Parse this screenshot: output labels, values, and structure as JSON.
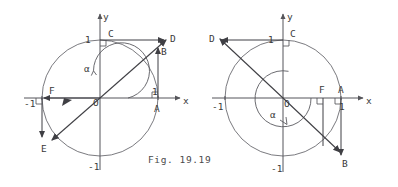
{
  "figure": {
    "caption": "Fig. 19.19",
    "panels": [
      {
        "id": "left",
        "name": "panel-left",
        "axis_labels": {
          "x": "x",
          "y": "y"
        },
        "ticks": {
          "x_pos": "1",
          "x_neg": "-1",
          "y_pos": "1",
          "y_neg": "-1"
        },
        "angle_label": "α",
        "points": [
          {
            "label": "A",
            "desc": "unit-point-on-positive-x-axis"
          },
          {
            "label": "B",
            "desc": "tangent-point-above-A"
          },
          {
            "label": "C",
            "desc": "unit-point-on-positive-y-axis"
          },
          {
            "label": "D",
            "desc": "cotangent-point-right-of-C"
          },
          {
            "label": "E",
            "desc": "terminal-point-lower-left-on-circle"
          },
          {
            "label": "F",
            "desc": "projection-point-on-negative-x-axis"
          }
        ]
      },
      {
        "id": "right",
        "name": "panel-right",
        "axis_labels": {
          "x": "x",
          "y": "y"
        },
        "ticks": {
          "x_pos": "1",
          "x_neg": "-1",
          "y_pos": "1",
          "y_neg": "-1"
        },
        "angle_label": "α",
        "points": [
          {
            "label": "A",
            "desc": "unit-point-on-positive-x-axis"
          },
          {
            "label": "B",
            "desc": "tangent-point-below-A"
          },
          {
            "label": "C",
            "desc": "unit-point-on-positive-y-axis"
          },
          {
            "label": "D",
            "desc": "cotangent-point-left-of-C"
          },
          {
            "label": "F",
            "desc": "projection-point-on-positive-x-axis"
          }
        ]
      }
    ]
  },
  "colors": {
    "ink": "#3f3f44",
    "axis": "#55555a",
    "circle": "#6b6b70",
    "background": "#ffffff"
  }
}
